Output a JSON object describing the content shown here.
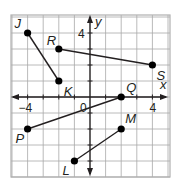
{
  "chart_data": {
    "type": "scatter",
    "title": "",
    "xlabel": "x",
    "ylabel": "y",
    "xlim": [
      -5,
      5
    ],
    "ylim": [
      -5,
      5
    ],
    "grid": true,
    "tick_labels": {
      "x": [
        {
          "value": -4,
          "label": "−4"
        },
        {
          "value": 4,
          "label": "4"
        }
      ],
      "y": [
        {
          "value": 4,
          "label": "4"
        }
      ],
      "origin": "0"
    },
    "points": [
      {
        "name": "J",
        "x": -4,
        "y": 4
      },
      {
        "name": "K",
        "x": -2,
        "y": 1
      },
      {
        "name": "R",
        "x": -2,
        "y": 3
      },
      {
        "name": "S",
        "x": 4,
        "y": 2
      },
      {
        "name": "Q",
        "x": 2,
        "y": 0
      },
      {
        "name": "P",
        "x": -4,
        "y": -2
      },
      {
        "name": "M",
        "x": 2,
        "y": -2
      },
      {
        "name": "L",
        "x": -1,
        "y": -4
      }
    ],
    "segments": [
      {
        "name": "JK",
        "from": "J",
        "to": "K"
      },
      {
        "name": "RS",
        "from": "R",
        "to": "S"
      },
      {
        "name": "PQ",
        "from": "P",
        "to": "Q"
      },
      {
        "name": "LM",
        "from": "L",
        "to": "M"
      }
    ]
  },
  "colors": {
    "grid": "#a8a8a8",
    "axis": "#231f20",
    "segment": "#231f20",
    "point": "#000000",
    "border": "#b0b0b0"
  }
}
